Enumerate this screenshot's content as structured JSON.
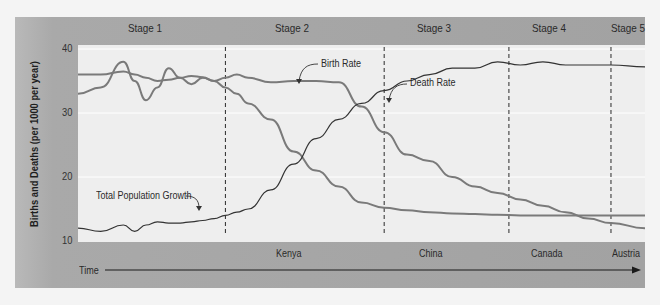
{
  "chart_data": {
    "type": "line",
    "xlabel": "Time",
    "ylabel": "Births and Deaths (per 1000 per year)",
    "ylim": [
      10,
      40
    ],
    "yticks": [
      10,
      20,
      30,
      40
    ],
    "grid": true,
    "stages": [
      "Stage 1",
      "Stage 2",
      "Stage 3",
      "Stage 4",
      "Stage 5"
    ],
    "stage_examples": [
      "Kenya",
      "China",
      "Canada",
      "Austria"
    ],
    "x": [
      0,
      4,
      8,
      10,
      12,
      14,
      16,
      18,
      20,
      22,
      24,
      26,
      28,
      30,
      34,
      38,
      42,
      46,
      50,
      54,
      58,
      62,
      66,
      70,
      74,
      78,
      82,
      86,
      90,
      94,
      100
    ],
    "series": [
      {
        "name": "Birth Rate",
        "color": "#7a7a7a",
        "values": [
          36,
          36,
          36.5,
          36,
          35.5,
          35,
          35.2,
          35.5,
          35.8,
          35.6,
          35,
          35.5,
          36,
          35.5,
          34.8,
          35,
          35,
          34.8,
          31,
          27,
          23.5,
          22.5,
          20,
          18.5,
          17.5,
          16.5,
          15.5,
          14.5,
          13.5,
          12.8,
          12
        ]
      },
      {
        "name": "Death Rate",
        "color": "#7a7a7a",
        "values": [
          33,
          34,
          38,
          35,
          32,
          34,
          37,
          35.5,
          34.5,
          35.5,
          35,
          34,
          33,
          31.5,
          29,
          24,
          21,
          18.5,
          16,
          15.2,
          14.8,
          14.5,
          14.3,
          14.2,
          14.1,
          14.0,
          14.0,
          14.0,
          14.0,
          14.0,
          14.0
        ]
      },
      {
        "name": "Total Population Growth",
        "color": "#333333",
        "values": [
          12,
          11.5,
          12.5,
          11.5,
          12.5,
          13,
          12.8,
          12.8,
          13,
          13.2,
          13.5,
          14,
          14.5,
          15,
          18,
          22,
          26,
          29,
          31.5,
          33.5,
          35,
          36,
          37,
          37,
          38,
          37.5,
          38,
          37.5,
          37.5,
          37.5,
          37.2
        ]
      }
    ],
    "annotations": [
      {
        "text": "Birth Rate",
        "series": "Birth Rate"
      },
      {
        "text": "Death Rate",
        "series": "Death Rate"
      },
      {
        "text": "Total Population Growth",
        "series": "Total Population Growth"
      }
    ],
    "stage_boundaries_x": [
      26,
      54,
      76,
      94
    ]
  },
  "labels": {
    "stage1": "Stage 1",
    "stage2": "Stage 2",
    "stage3": "Stage 3",
    "stage4": "Stage 4",
    "stage5": "Stage 5",
    "kenya": "Kenya",
    "china": "China",
    "canada": "Canada",
    "austria": "Austria",
    "time": "Time",
    "ylabel": "Births and Deaths (per 1000 per year)",
    "y40": "40",
    "y30": "30",
    "y20": "20",
    "y10": "10",
    "birth_rate": "Birth Rate",
    "death_rate": "Death Rate",
    "total_growth": "Total Population Growth"
  }
}
